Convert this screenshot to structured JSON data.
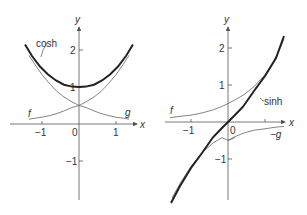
{
  "left_plot": {
    "x_axis_label": "x",
    "y_axis_label": "y",
    "x_ticks": [
      "−1",
      "0",
      "1"
    ],
    "y_ticks": [
      "2",
      "1",
      "−1"
    ],
    "curves": {
      "main": "cosh",
      "f": "f",
      "g": "g"
    }
  },
  "right_plot": {
    "x_axis_label": "x",
    "y_axis_label": "y",
    "x_ticks": [
      "−1",
      "0"
    ],
    "y_ticks": [
      "2",
      "1",
      "−1"
    ],
    "curves": {
      "main": "sinh",
      "f": "f",
      "neg_g": "−g"
    }
  },
  "colors": {
    "axis": "#555555",
    "main_curve": "#222222",
    "aux_curve": "#666666"
  }
}
